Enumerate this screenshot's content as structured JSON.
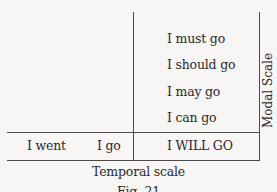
{
  "diagram": {
    "modal_items": [
      "I must go",
      "I should go",
      "I may go",
      "I can go"
    ],
    "temporal_items": [
      "I went",
      "I go",
      "I WILL GO"
    ],
    "temporal_axis_label": "Temporal scale",
    "modal_axis_label": "Modal Scale",
    "caption": "Fig. 21"
  }
}
